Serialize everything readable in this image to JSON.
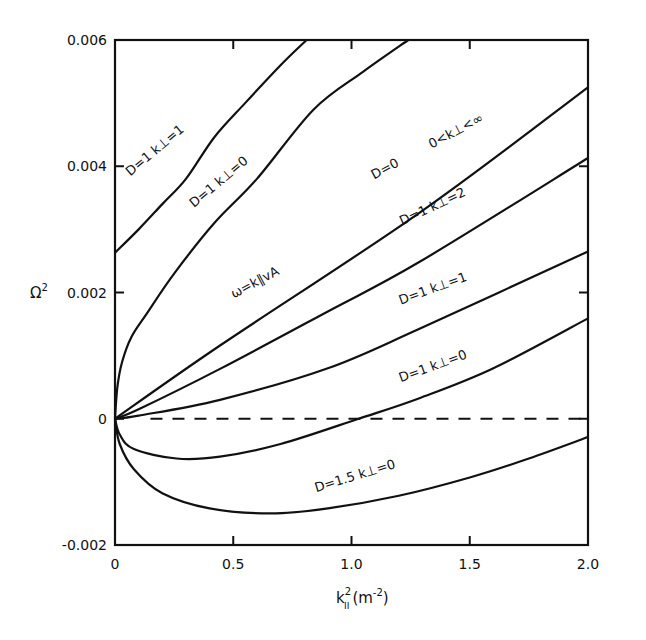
{
  "chart_data": {
    "type": "line",
    "title": "",
    "xlabel": "k∥² (m⁻²)",
    "xlabel_parts": {
      "base": "k",
      "sup": "2",
      "sub": "II",
      "unit": "(m",
      "unit_sup": "-2",
      "unit_close": ")"
    },
    "ylabel": "Ω²",
    "ylabel_parts": {
      "base": "Ω",
      "sup": "2"
    },
    "xlim": [
      0,
      2.0
    ],
    "ylim": [
      -0.002,
      0.006
    ],
    "grid": false,
    "legend": "inline curve labels",
    "x_ticks": [
      {
        "value": 0,
        "label": "0"
      },
      {
        "value": 0.5,
        "label": "0.5"
      },
      {
        "value": 1.0,
        "label": "1.0"
      },
      {
        "value": 1.5,
        "label": "1.5"
      },
      {
        "value": 2.0,
        "label": "2.0"
      }
    ],
    "y_ticks": [
      {
        "value": 0.006,
        "label": "0.006"
      },
      {
        "value": 0.004,
        "label": "0.004"
      },
      {
        "value": 0.002,
        "label": "0.002"
      },
      {
        "value": 0,
        "label": "0"
      },
      {
        "value": -0.002,
        "label": "-0.002"
      }
    ],
    "series": [
      {
        "name": "D=1 k⊥=1",
        "x": [
          0,
          0.1,
          0.2,
          0.3,
          0.42,
          0.55,
          0.7,
          0.81
        ],
        "y": [
          0.00263,
          0.003,
          0.0034,
          0.0038,
          0.00446,
          0.005,
          0.0056,
          0.006
        ]
      },
      {
        "name": "D=1 k⊥=0",
        "x": [
          0,
          0.01,
          0.03,
          0.07,
          0.135,
          0.25,
          0.42,
          0.6,
          0.84,
          1.05,
          1.24
        ],
        "y": [
          0,
          0.0005,
          0.0009,
          0.0013,
          0.00167,
          0.0023,
          0.0031,
          0.0038,
          0.0049,
          0.0055,
          0.006
        ]
      },
      {
        "name": "D=0 0<k⊥<∞ (ω=k∥vA)",
        "x": [
          0,
          0.444,
          1.29,
          2.0
        ],
        "y": [
          0,
          0.00116,
          0.00327,
          0.00525
        ]
      },
      {
        "name": "D=1 k⊥=2",
        "x": [
          0,
          0.1,
          0.444,
          0.9,
          1.29,
          2.0
        ],
        "y": [
          0,
          0.00015,
          0.00079,
          0.0017,
          0.00249,
          0.00413
        ]
      },
      {
        "name": "D=1 k⊥=1",
        "x": [
          0,
          0.1,
          0.444,
          0.9,
          1.29,
          2.0
        ],
        "y": [
          0,
          5e-05,
          0.0003,
          0.0008,
          0.00143,
          0.00265
        ]
      },
      {
        "name": "D=1 k⊥=0",
        "x": [
          0,
          0.02,
          0.08,
          0.26,
          0.444,
          0.7,
          1.03,
          1.29,
          1.6,
          2.0
        ],
        "y": [
          0,
          -0.00025,
          -0.00048,
          -0.00063,
          -0.0006,
          -0.0004,
          0,
          0.00033,
          0.0008,
          0.00159
        ]
      },
      {
        "name": "D=1.5 k⊥=0",
        "x": [
          0,
          0.02,
          0.08,
          0.2,
          0.4,
          0.66,
          0.9,
          1.2,
          1.5,
          1.75,
          2.0
        ],
        "y": [
          0,
          -0.0004,
          -0.0008,
          -0.00118,
          -0.00142,
          -0.0015,
          -0.00142,
          -0.00122,
          -0.00093,
          -0.00063,
          -0.00029
        ]
      },
      {
        "name": "zero reference (dashed)",
        "x": [
          0.15,
          2.0
        ],
        "y": [
          0,
          0
        ],
        "style": "dashed"
      }
    ],
    "annotations": [
      {
        "text": "D=1  k⊥=1",
        "x": 0.18,
        "y": 0.0042,
        "angle": -40
      },
      {
        "text": "D=1  k⊥=0",
        "x": 0.45,
        "y": 0.0037,
        "angle": -40
      },
      {
        "text": "ω=k∥vA",
        "x": 0.6,
        "y": 0.0021,
        "angle": -28
      },
      {
        "text": "D=0",
        "x": 1.15,
        "y": 0.0039,
        "angle": -28
      },
      {
        "text": "0<k⊥<∞",
        "x": 1.45,
        "y": 0.0045,
        "angle": -28
      },
      {
        "text": "D=1  k⊥=2",
        "x": 1.35,
        "y": 0.0033,
        "angle": -25
      },
      {
        "text": "D=1  k⊥=1",
        "x": 1.35,
        "y": 0.002,
        "angle": -20
      },
      {
        "text": "D=1  k⊥=0",
        "x": 1.35,
        "y": 0.00077,
        "angle": -20
      },
      {
        "text": "D=1.5  k⊥=0",
        "x": 1.02,
        "y": -0.00097,
        "angle": -17
      }
    ]
  }
}
